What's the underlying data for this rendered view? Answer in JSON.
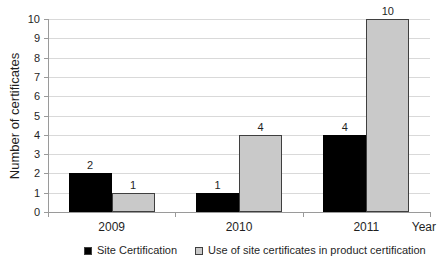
{
  "chart_data": {
    "type": "bar",
    "title": "",
    "categories": [
      "2009",
      "2010",
      "2011"
    ],
    "series": [
      {
        "name": "Site Certification",
        "color": "#000000",
        "border_color": "#000000",
        "values": [
          2,
          1,
          4
        ]
      },
      {
        "name": "Use of site certificates in product certification",
        "color": "#c9c9c9",
        "border_color": "#3f3f3f",
        "values": [
          1,
          4,
          10
        ]
      }
    ],
    "xlabel": "Year",
    "ylabel": "Number of certificates",
    "ylim": [
      0,
      10
    ],
    "yticks": [
      0,
      1,
      2,
      3,
      4,
      5,
      6,
      7,
      8,
      9,
      10
    ],
    "grid": true,
    "show_value_labels": true,
    "legend_position": "bottom",
    "legend_clipped_at_bottom": true
  },
  "colors": {
    "background": "#ffffff",
    "gridline": "#d9d9d9",
    "axis": "#9a9a9a",
    "text": "#1f1f1f"
  }
}
